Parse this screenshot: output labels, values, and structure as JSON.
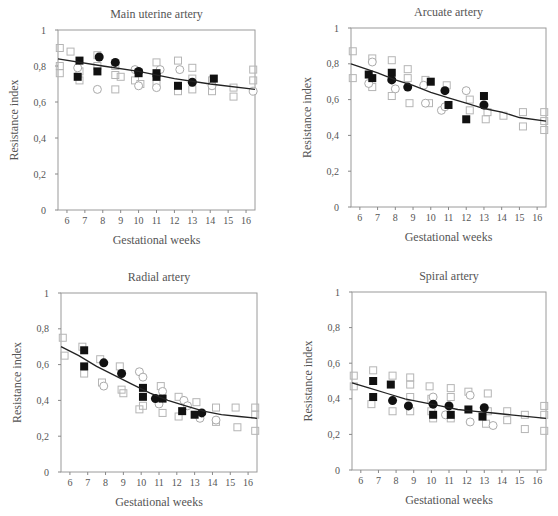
{
  "figure": {
    "ylabel": "Resistance index",
    "xlabel": "Gestational weeks",
    "xticks": [
      6,
      7,
      8,
      9,
      10,
      11,
      12,
      13,
      14,
      15,
      16
    ],
    "yticks": [
      "0",
      "0,2",
      "0,4",
      "0,6",
      "0,8",
      "1"
    ]
  },
  "chart_data": [
    {
      "type": "scatter",
      "title": "Main uterine artery",
      "xlabel": "Gestational weeks",
      "ylabel": "Resistance index",
      "xlim": [
        5.5,
        16.5
      ],
      "ylim": [
        0,
        1
      ],
      "grid": false,
      "box": {
        "left": 58,
        "top": 30,
        "right": 255,
        "bottom": 210
      },
      "fit_line": {
        "x": [
          5.5,
          16.5
        ],
        "y_start": 0.84,
        "y_end": 0.67,
        "curve": [
          [
            5.5,
            0.84
          ],
          [
            8,
            0.8
          ],
          [
            10,
            0.77
          ],
          [
            12,
            0.73
          ],
          [
            14,
            0.7
          ],
          [
            16.5,
            0.67
          ]
        ]
      },
      "series": [
        {
          "name": "filled-square",
          "marker": "square-filled",
          "points": [
            [
              6.7,
              0.83
            ],
            [
              6.6,
              0.74
            ],
            [
              7.7,
              0.77
            ],
            [
              10,
              0.76
            ],
            [
              11,
              0.76
            ],
            [
              11,
              0.74
            ],
            [
              12.2,
              0.69
            ],
            [
              14.2,
              0.73
            ]
          ]
        },
        {
          "name": "filled-circle",
          "marker": "circle-filled",
          "points": [
            [
              7.8,
              0.85
            ],
            [
              8.7,
              0.82
            ],
            [
              10,
              0.77
            ],
            [
              13,
              0.71
            ]
          ]
        },
        {
          "name": "open-circle",
          "marker": "circle-open",
          "points": [
            [
              6.6,
              0.79
            ],
            [
              7.7,
              0.67
            ],
            [
              9.8,
              0.78
            ],
            [
              10,
              0.69
            ],
            [
              11,
              0.68
            ],
            [
              11.2,
              0.78
            ],
            [
              12.3,
              0.78
            ],
            [
              14.1,
              0.69
            ],
            [
              16.4,
              0.66
            ]
          ]
        },
        {
          "name": "open-square",
          "marker": "square-open",
          "points": [
            [
              5.6,
              0.9
            ],
            [
              5.6,
              0.8
            ],
            [
              5.6,
              0.76
            ],
            [
              6.2,
              0.88
            ],
            [
              6.7,
              0.77
            ],
            [
              6.7,
              0.72
            ],
            [
              7.7,
              0.86
            ],
            [
              7.7,
              0.8
            ],
            [
              8.7,
              0.8
            ],
            [
              8.7,
              0.75
            ],
            [
              8.7,
              0.67
            ],
            [
              9,
              0.74
            ],
            [
              9.8,
              0.72
            ],
            [
              10.1,
              0.7
            ],
            [
              11,
              0.82
            ],
            [
              11,
              0.7
            ],
            [
              12.2,
              0.83
            ],
            [
              12.2,
              0.66
            ],
            [
              13,
              0.79
            ],
            [
              13,
              0.73
            ],
            [
              13,
              0.67
            ],
            [
              14.1,
              0.72
            ],
            [
              14.1,
              0.66
            ],
            [
              15.3,
              0.68
            ],
            [
              15.3,
              0.63
            ],
            [
              16.4,
              0.78
            ],
            [
              16.4,
              0.72
            ]
          ]
        }
      ]
    },
    {
      "type": "scatter",
      "title": "Arcuate artery",
      "xlabel": "Gestational weeks",
      "ylabel": "Resistance index",
      "xlim": [
        5.5,
        16.5
      ],
      "ylim": [
        0,
        1
      ],
      "grid": false,
      "box": {
        "left": 351,
        "top": 28,
        "right": 546,
        "bottom": 207
      },
      "fit_line": {
        "curve": [
          [
            5.5,
            0.8
          ],
          [
            7,
            0.75
          ],
          [
            8,
            0.71
          ],
          [
            9,
            0.68
          ],
          [
            10,
            0.64
          ],
          [
            11,
            0.61
          ],
          [
            12,
            0.58
          ],
          [
            13,
            0.55
          ],
          [
            14,
            0.53
          ],
          [
            15,
            0.5
          ],
          [
            16.5,
            0.48
          ]
        ]
      },
      "series": [
        {
          "name": "filled-square",
          "marker": "square-filled",
          "points": [
            [
              6.5,
              0.74
            ],
            [
              6.7,
              0.72
            ],
            [
              7.8,
              0.75
            ],
            [
              10,
              0.7
            ],
            [
              11,
              0.57
            ],
            [
              12,
              0.49
            ],
            [
              13,
              0.62
            ]
          ]
        },
        {
          "name": "filled-circle",
          "marker": "circle-filled",
          "points": [
            [
              7.8,
              0.71
            ],
            [
              8.7,
              0.67
            ],
            [
              10.8,
              0.65
            ],
            [
              13,
              0.57
            ]
          ]
        },
        {
          "name": "open-circle",
          "marker": "circle-open",
          "points": [
            [
              6.7,
              0.81
            ],
            [
              6.5,
              0.69
            ],
            [
              8,
              0.66
            ],
            [
              9.6,
              0.68
            ],
            [
              9.7,
              0.58
            ],
            [
              10.6,
              0.54
            ],
            [
              10.8,
              0.56
            ],
            [
              12,
              0.65
            ]
          ]
        },
        {
          "name": "open-square",
          "marker": "square-open",
          "points": [
            [
              5.6,
              0.87
            ],
            [
              5.6,
              0.72
            ],
            [
              6.7,
              0.83
            ],
            [
              6.7,
              0.67
            ],
            [
              7.8,
              0.82
            ],
            [
              7.8,
              0.62
            ],
            [
              8.7,
              0.77
            ],
            [
              8.7,
              0.72
            ],
            [
              8.8,
              0.58
            ],
            [
              9.7,
              0.71
            ],
            [
              9.9,
              0.58
            ],
            [
              10.9,
              0.68
            ],
            [
              12.2,
              0.6
            ],
            [
              12.2,
              0.54
            ],
            [
              13.2,
              0.53
            ],
            [
              13.1,
              0.49
            ],
            [
              14.1,
              0.51
            ],
            [
              15.2,
              0.53
            ],
            [
              15.2,
              0.45
            ],
            [
              16.4,
              0.53
            ],
            [
              16.4,
              0.48
            ],
            [
              16.4,
              0.43
            ]
          ]
        }
      ]
    },
    {
      "type": "scatter",
      "title": "Radial artery",
      "xlabel": "Gestational weeks",
      "ylabel": "Resistance index",
      "xlim": [
        5.5,
        16.5
      ],
      "ylim": [
        0,
        1
      ],
      "grid": false,
      "box": {
        "left": 61,
        "top": 293,
        "right": 257,
        "bottom": 472
      },
      "fit_line": {
        "curve": [
          [
            5.5,
            0.7
          ],
          [
            6.5,
            0.65
          ],
          [
            7.5,
            0.59
          ],
          [
            8.5,
            0.54
          ],
          [
            9.5,
            0.49
          ],
          [
            10.5,
            0.44
          ],
          [
            11.5,
            0.4
          ],
          [
            12.5,
            0.37
          ],
          [
            13.5,
            0.34
          ],
          [
            14.5,
            0.32
          ],
          [
            15.5,
            0.31
          ],
          [
            16.5,
            0.3
          ]
        ]
      },
      "series": [
        {
          "name": "filled-square",
          "marker": "square-filled",
          "points": [
            [
              6.8,
              0.68
            ],
            [
              6.8,
              0.59
            ],
            [
              10.1,
              0.47
            ],
            [
              10.1,
              0.42
            ],
            [
              11.2,
              0.41
            ],
            [
              12.3,
              0.34
            ],
            [
              13,
              0.32
            ]
          ]
        },
        {
          "name": "filled-circle",
          "marker": "circle-filled",
          "points": [
            [
              7.9,
              0.61
            ],
            [
              8.9,
              0.55
            ],
            [
              10.8,
              0.41
            ],
            [
              13.4,
              0.33
            ]
          ]
        },
        {
          "name": "open-circle",
          "marker": "circle-open",
          "points": [
            [
              7.9,
              0.48
            ],
            [
              9.9,
              0.56
            ],
            [
              10.1,
              0.53
            ],
            [
              11.2,
              0.45
            ],
            [
              11,
              0.38
            ],
            [
              12.4,
              0.4
            ],
            [
              12.6,
              0.37
            ],
            [
              13.3,
              0.3
            ],
            [
              14.2,
              0.29
            ]
          ]
        },
        {
          "name": "open-square",
          "marker": "square-open",
          "points": [
            [
              5.6,
              0.75
            ],
            [
              5.7,
              0.65
            ],
            [
              6.7,
              0.7
            ],
            [
              6.8,
              0.55
            ],
            [
              7.7,
              0.63
            ],
            [
              7.8,
              0.5
            ],
            [
              8.8,
              0.59
            ],
            [
              8.9,
              0.46
            ],
            [
              9,
              0.44
            ],
            [
              9.9,
              0.35
            ],
            [
              10.1,
              0.37
            ],
            [
              11.1,
              0.48
            ],
            [
              11.2,
              0.33
            ],
            [
              12.1,
              0.42
            ],
            [
              12.1,
              0.31
            ],
            [
              13.1,
              0.39
            ],
            [
              14.2,
              0.36
            ],
            [
              14.2,
              0.28
            ],
            [
              15.3,
              0.36
            ],
            [
              15.4,
              0.25
            ],
            [
              16.4,
              0.36
            ],
            [
              16.4,
              0.32
            ],
            [
              16.4,
              0.23
            ]
          ]
        }
      ]
    },
    {
      "type": "scatter",
      "title": "Spiral artery",
      "xlabel": "Gestational weeks",
      "ylabel": "Resistance index",
      "xlim": [
        5.5,
        16.5
      ],
      "ylim": [
        0,
        1
      ],
      "grid": false,
      "box": {
        "left": 352,
        "top": 292,
        "right": 546,
        "bottom": 470
      },
      "fit_line": {
        "curve": [
          [
            5.5,
            0.49
          ],
          [
            6.5,
            0.46
          ],
          [
            7.5,
            0.43
          ],
          [
            8.5,
            0.4
          ],
          [
            9.5,
            0.38
          ],
          [
            10.5,
            0.36
          ],
          [
            11.5,
            0.34
          ],
          [
            12.5,
            0.33
          ],
          [
            13.5,
            0.32
          ],
          [
            14.5,
            0.31
          ],
          [
            15.5,
            0.3
          ],
          [
            16.5,
            0.29
          ]
        ]
      },
      "series": [
        {
          "name": "filled-square",
          "marker": "square-filled",
          "points": [
            [
              6.7,
              0.5
            ],
            [
              6.7,
              0.41
            ],
            [
              7.7,
              0.48
            ],
            [
              10.1,
              0.31
            ],
            [
              11.1,
              0.31
            ],
            [
              12.1,
              0.34
            ],
            [
              12.9,
              0.3
            ]
          ]
        },
        {
          "name": "filled-circle",
          "marker": "circle-filled",
          "points": [
            [
              7.8,
              0.39
            ],
            [
              8.7,
              0.36
            ],
            [
              10.1,
              0.37
            ],
            [
              11,
              0.36
            ],
            [
              13,
              0.35
            ]
          ]
        },
        {
          "name": "open-circle",
          "marker": "circle-open",
          "points": [
            [
              10.1,
              0.41
            ],
            [
              10.8,
              0.31
            ],
            [
              12.2,
              0.42
            ],
            [
              12.2,
              0.27
            ],
            [
              13.5,
              0.25
            ]
          ]
        },
        {
          "name": "open-square",
          "marker": "square-open",
          "points": [
            [
              5.6,
              0.53
            ],
            [
              5.6,
              0.47
            ],
            [
              6.7,
              0.56
            ],
            [
              6.6,
              0.37
            ],
            [
              7.8,
              0.53
            ],
            [
              7.8,
              0.33
            ],
            [
              8.8,
              0.52
            ],
            [
              8.8,
              0.48
            ],
            [
              8.8,
              0.41
            ],
            [
              8.8,
              0.33
            ],
            [
              9.9,
              0.47
            ],
            [
              10,
              0.4
            ],
            [
              10,
              0.33
            ],
            [
              10.1,
              0.29
            ],
            [
              11.1,
              0.46
            ],
            [
              11.1,
              0.41
            ],
            [
              11.1,
              0.29
            ],
            [
              12.1,
              0.44
            ],
            [
              13.2,
              0.43
            ],
            [
              13.2,
              0.33
            ],
            [
              13.1,
              0.26
            ],
            [
              14.3,
              0.33
            ],
            [
              14.3,
              0.28
            ],
            [
              15.3,
              0.31
            ],
            [
              15.3,
              0.23
            ],
            [
              16.4,
              0.36
            ],
            [
              16.4,
              0.31
            ],
            [
              16.4,
              0.22
            ]
          ]
        }
      ]
    }
  ]
}
